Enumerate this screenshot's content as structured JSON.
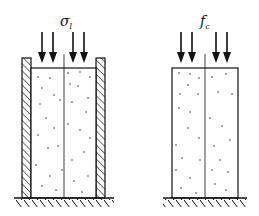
{
  "diagram": {
    "left": {
      "label_main": "σ",
      "label_sub": "l",
      "description": "confined specimen with rigid side walls"
    },
    "right": {
      "label_main": "f",
      "label_sub": "c",
      "description": "unconfined specimen"
    },
    "colors": {
      "stroke": "#111111",
      "background": "#ffffff"
    }
  }
}
